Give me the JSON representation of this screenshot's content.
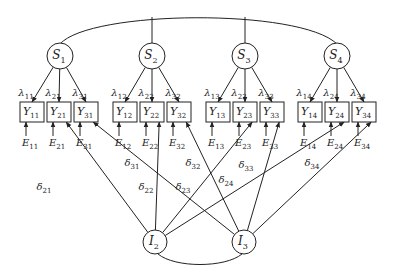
{
  "diagram": {
    "type": "structural-equation-model",
    "latent_top": [
      {
        "id": "S1",
        "label": "S",
        "sub": "1",
        "cx": 60,
        "cy": 56
      },
      {
        "id": "S2",
        "label": "S",
        "sub": "2",
        "cx": 152,
        "cy": 56
      },
      {
        "id": "S3",
        "label": "S",
        "sub": "3",
        "cx": 245,
        "cy": 56
      },
      {
        "id": "S4",
        "label": "S",
        "sub": "4",
        "cx": 337,
        "cy": 56
      }
    ],
    "latent_bottom": [
      {
        "id": "I2",
        "label": "I",
        "sub": "2",
        "cx": 155,
        "cy": 242
      },
      {
        "id": "I3",
        "label": "I",
        "sub": "3",
        "cx": 244,
        "cy": 242
      }
    ],
    "observed": [
      {
        "id": "Y11",
        "label": "Y",
        "sub": "11",
        "x": 20,
        "group": 0,
        "lambda": "11",
        "error": "11"
      },
      {
        "id": "Y21",
        "label": "Y",
        "sub": "21",
        "x": 47,
        "group": 0,
        "lambda": "21",
        "error": "21"
      },
      {
        "id": "Y31",
        "label": "Y",
        "sub": "31",
        "x": 74,
        "group": 0,
        "lambda": "31",
        "error": "31"
      },
      {
        "id": "Y12",
        "label": "Y",
        "sub": "12",
        "x": 113,
        "group": 1,
        "lambda": "12",
        "error": "12"
      },
      {
        "id": "Y22",
        "label": "Y",
        "sub": "22",
        "x": 140,
        "group": 1,
        "lambda": "22",
        "error": "22"
      },
      {
        "id": "Y32",
        "label": "Y",
        "sub": "32",
        "x": 167,
        "group": 1,
        "lambda": "32",
        "error": "32"
      },
      {
        "id": "Y13",
        "label": "Y",
        "sub": "13",
        "x": 206,
        "group": 2,
        "lambda": "13",
        "error": "13"
      },
      {
        "id": "Y23",
        "label": "Y",
        "sub": "23",
        "x": 233,
        "group": 2,
        "lambda": "23",
        "error": "23"
      },
      {
        "id": "Y33",
        "label": "Y",
        "sub": "33",
        "x": 260,
        "group": 2,
        "lambda": "33",
        "error": "33"
      },
      {
        "id": "Y14",
        "label": "Y",
        "sub": "14",
        "x": 298,
        "group": 3,
        "lambda": "14",
        "error": "14"
      },
      {
        "id": "Y24",
        "label": "Y",
        "sub": "24",
        "x": 325,
        "group": 3,
        "lambda": "24",
        "error": "24"
      },
      {
        "id": "Y34",
        "label": "Y",
        "sub": "34",
        "x": 352,
        "group": 3,
        "lambda": "34",
        "error": "34"
      }
    ],
    "box": {
      "y": 102,
      "w": 24,
      "h": 20
    },
    "loading_symbol": "λ",
    "error_symbol": "E",
    "delta_symbol": "δ",
    "delta_paths": [
      {
        "from": "I2",
        "to": "Y21",
        "sub": "21",
        "lx": 36,
        "ly": 190
      },
      {
        "from": "I2",
        "to": "Y22",
        "sub": "22",
        "lx": 138,
        "ly": 190
      },
      {
        "from": "I2",
        "to": "Y23",
        "sub": "23",
        "lx": 175,
        "ly": 190
      },
      {
        "from": "I2",
        "to": "Y24",
        "sub": "24",
        "lx": 218,
        "ly": 183
      },
      {
        "from": "I3",
        "to": "Y31",
        "sub": "31",
        "lx": 124,
        "ly": 166
      },
      {
        "from": "I3",
        "to": "Y32",
        "sub": "32",
        "lx": 185,
        "ly": 166
      },
      {
        "from": "I3",
        "to": "Y33",
        "sub": "33",
        "lx": 238,
        "ly": 168
      },
      {
        "from": "I3",
        "to": "Y34",
        "sub": "34",
        "lx": 304,
        "ly": 166
      }
    ]
  }
}
